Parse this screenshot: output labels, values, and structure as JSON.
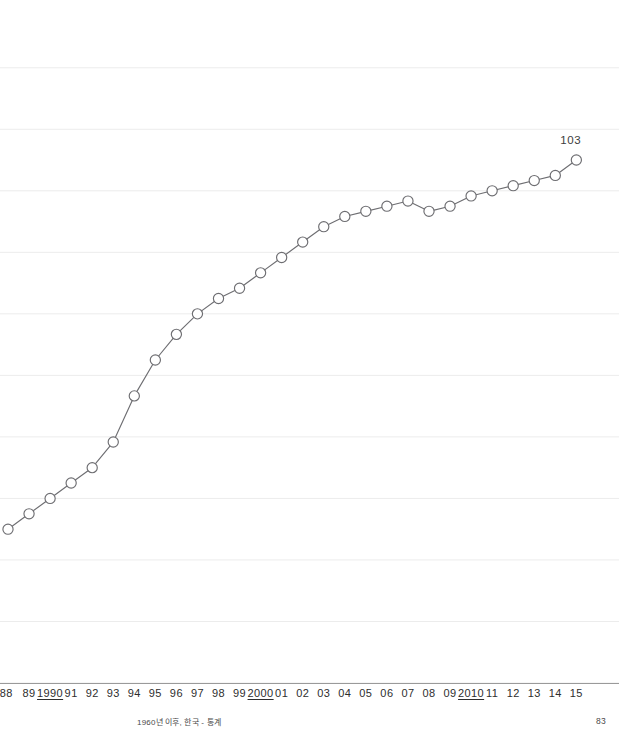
{
  "page": {
    "caption": "1960년 이후, 한국 - 통계",
    "page_number": "83",
    "background": "#ffffff"
  },
  "chart_data": {
    "type": "line",
    "title": "",
    "subtitle": "",
    "xlabel": "",
    "ylabel": "",
    "grid": true,
    "legend": null,
    "line_color": "#6e6e72",
    "marker_fill": "#ffffff",
    "marker_stroke": "#6e6e72",
    "gridline_color": "#ececec",
    "axis_color": "#9a9a9a",
    "annotation": {
      "text": "103",
      "x": "15",
      "value": 103
    },
    "note": "Left edge of the plot is clipped by the page margin; the 1988 marker is cut off.",
    "xlim": [
      1988,
      2015
    ],
    "ylim": [
      52,
      115
    ],
    "x_tick_labels": [
      "88",
      "89",
      "1990",
      "91",
      "92",
      "93",
      "94",
      "95",
      "96",
      "97",
      "98",
      "99",
      "2000",
      "01",
      "02",
      "03",
      "04",
      "05",
      "06",
      "07",
      "08",
      "09",
      "2010",
      "11",
      "12",
      "13",
      "14",
      "15"
    ],
    "x_tick_major": [
      "1990",
      "2000",
      "2010"
    ],
    "categories": [
      1988,
      1989,
      1990,
      1991,
      1992,
      1993,
      1994,
      1995,
      1996,
      1997,
      1998,
      1999,
      2000,
      2001,
      2002,
      2003,
      2004,
      2005,
      2006,
      2007,
      2008,
      2009,
      2010,
      2011,
      2012,
      2013,
      2014,
      2015
    ],
    "values": [
      67.0,
      68.5,
      70.0,
      71.5,
      73.0,
      75.5,
      80.0,
      83.5,
      86.0,
      88.0,
      89.5,
      90.5,
      92.0,
      93.5,
      95.0,
      96.5,
      97.5,
      98.0,
      98.5,
      99.0,
      98.0,
      98.5,
      99.5,
      100.0,
      100.5,
      101.0,
      101.5,
      103.0
    ],
    "y_gridlines": [
      52.0,
      58.0,
      64.0,
      70.0,
      76.0,
      82.0,
      88.0,
      94.0,
      100.0,
      106.0,
      112.0
    ]
  }
}
